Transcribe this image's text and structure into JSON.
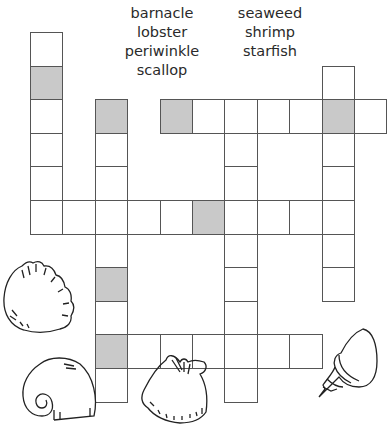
{
  "title_fragment": "",
  "word_bank": {
    "left": [
      "barnacle",
      "lobster",
      "periwinkle",
      "scallop"
    ],
    "right": [
      "seaweed",
      "shrimp",
      "starfish"
    ]
  },
  "grid": {
    "origin_x": 30,
    "origin_y": 32,
    "cell_w": 32.4,
    "cell_h": 33.6,
    "shade_color": "#c9c9c9",
    "entries": [
      {
        "id": "down-col0",
        "direction": "down",
        "col": 0,
        "row": 0,
        "length": 6,
        "shaded": [
          1
        ]
      },
      {
        "id": "down-col2",
        "direction": "down",
        "col": 2,
        "row": 2,
        "length": 9,
        "shaded": [
          0,
          5,
          7
        ]
      },
      {
        "id": "across-row2",
        "direction": "across",
        "col": 4,
        "row": 2,
        "length": 7,
        "shaded": [
          0,
          5
        ]
      },
      {
        "id": "down-col6",
        "direction": "down",
        "col": 6,
        "row": 2,
        "length": 9,
        "shaded": []
      },
      {
        "id": "down-col9",
        "direction": "down",
        "col": 9,
        "row": 1,
        "length": 7,
        "shaded": [
          1
        ]
      },
      {
        "id": "across-row5",
        "direction": "across",
        "col": 0,
        "row": 5,
        "length": 10,
        "shaded": [
          5
        ]
      },
      {
        "id": "across-row9",
        "direction": "across",
        "col": 2,
        "row": 9,
        "length": 7,
        "shaded": [
          0
        ]
      }
    ]
  },
  "decorations": [
    {
      "name": "scallop-shell-icon",
      "x": 0,
      "y": 258
    },
    {
      "name": "moon-snail-shell-icon",
      "x": 18,
      "y": 354
    },
    {
      "name": "cockle-shell-icon",
      "x": 136,
      "y": 350
    },
    {
      "name": "whelk-shell-icon",
      "x": 315,
      "y": 325
    }
  ]
}
